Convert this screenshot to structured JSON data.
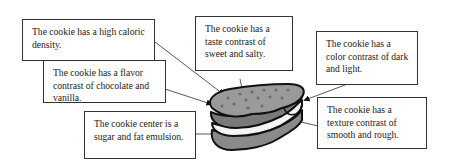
{
  "diagram": {
    "topic": "cookie",
    "callouts": [
      {
        "id": "caloric",
        "text": "The cookie has a high caloric density."
      },
      {
        "id": "taste",
        "text": "The cookie has a taste contrast of sweet and salty."
      },
      {
        "id": "color",
        "text": "The cookie has a color contrast of dark and light."
      },
      {
        "id": "flavor",
        "text": "The cookie has a flavor contrast of chocolate and vanilla."
      },
      {
        "id": "center",
        "text": "The cookie center is a sugar and fat emulsion."
      },
      {
        "id": "texture",
        "text": "The cookie has a texture contrast of smooth and rough."
      }
    ],
    "image": "sandwich-cookie-with-bite"
  }
}
